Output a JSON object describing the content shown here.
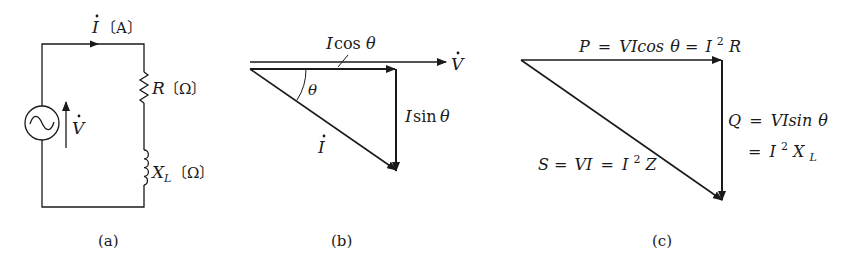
{
  "colors": {
    "ink": "#1a1a1a",
    "background": "#ffffff"
  },
  "circuit_a": {
    "caption": "(a)",
    "current_label": {
      "symbol": "I",
      "unit": "〔A〕"
    },
    "resistor_label": {
      "symbol": "R",
      "unit": "〔Ω〕"
    },
    "inductor_label": {
      "symbol": "X",
      "subscript": "L",
      "unit": "〔Ω〕"
    },
    "voltage_label": {
      "symbol": "V"
    },
    "source_symbol": "~"
  },
  "phasor_b": {
    "caption": "(b)",
    "voltage_label": "V",
    "current_label": "I",
    "angle_label": "θ",
    "cos_label": {
      "symbol": "I",
      "func": "cos",
      "angle": "θ"
    },
    "sin_label": {
      "symbol": "I",
      "func": "sin",
      "angle": "θ"
    }
  },
  "power_c": {
    "caption": "(c)",
    "p_label": {
      "lhs": "P",
      "eq1": "VIcos",
      "angle": "θ",
      "eq2": "I",
      "exp": "2",
      "tail": "R"
    },
    "q_label": {
      "lhs": "Q",
      "eq1": "VIsin",
      "angle": "θ",
      "eq2": "I",
      "exp": "2",
      "tail": "X",
      "sub": "L"
    },
    "s_label": {
      "lhs": "S",
      "eq1": "VI",
      "eq2": "I",
      "exp": "2",
      "tail": "Z"
    }
  }
}
